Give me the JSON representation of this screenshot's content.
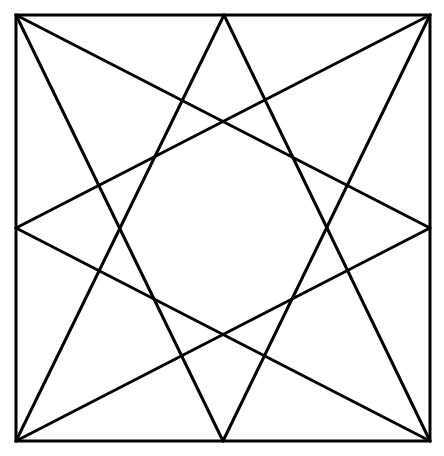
{
  "diagram": {
    "stroke_color": "#000000",
    "background": "#ffffff",
    "stroke_width": 3,
    "square": {
      "x1": 16,
      "y1": 15,
      "x2": 430,
      "y2": 441
    },
    "points": {
      "top_left": [
        16,
        15
      ],
      "top_right": [
        430,
        15
      ],
      "bottom_left": [
        16,
        441
      ],
      "bottom_right": [
        430,
        441
      ],
      "mid_top": [
        224,
        15
      ],
      "mid_bottom": [
        223,
        441
      ],
      "mid_left": [
        16,
        228
      ],
      "mid_right": [
        430,
        228
      ]
    },
    "lines": [
      [
        "top_left",
        "mid_right"
      ],
      [
        "top_left",
        "mid_bottom"
      ],
      [
        "top_right",
        "mid_left"
      ],
      [
        "top_right",
        "mid_bottom"
      ],
      [
        "bottom_left",
        "mid_top"
      ],
      [
        "bottom_left",
        "mid_right"
      ],
      [
        "bottom_right",
        "mid_top"
      ],
      [
        "bottom_right",
        "mid_left"
      ]
    ]
  }
}
